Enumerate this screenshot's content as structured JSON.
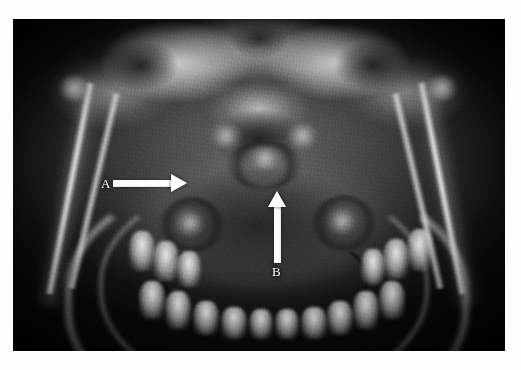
{
  "figure": {
    "kind": "panoramic-dental-radiograph",
    "modality": "X-ray",
    "region": "mandible and maxilla",
    "plate": {
      "left": 13,
      "top": 19,
      "width": 492,
      "height": 332,
      "background_color": "#111111",
      "bone_color": "#cfcfcf",
      "soft_tissue_color": "#4a4a4a",
      "cavity_color": "#161616"
    },
    "page_background": "#ffffff"
  },
  "annotations": {
    "accent_color": "#ffffff",
    "items": [
      {
        "id": "A",
        "label": "A",
        "icon": "arrow-right-icon",
        "direction": "right",
        "points_at": "left mandibular ramus / angle region",
        "shaft": {
          "x": 100,
          "y": 161,
          "length": 62,
          "thickness": 7
        },
        "tip": {
          "x": 174,
          "y": 165
        },
        "label_position": {
          "x": 88,
          "y": 158
        }
      },
      {
        "id": "B",
        "label": "B",
        "icon": "arrow-up-icon",
        "direction": "up",
        "points_at": "mandibular symphysis / midline region",
        "shaft": {
          "x": 261,
          "y": 186,
          "length": 58,
          "thickness": 7
        },
        "tip": {
          "x": 265,
          "y": 172
        },
        "label_position": {
          "x": 259,
          "y": 246
        }
      }
    ]
  },
  "caption": {
    "visible_text": "",
    "note": "bottom caption line is cropped; only the faint tops of glyphs are visible"
  }
}
